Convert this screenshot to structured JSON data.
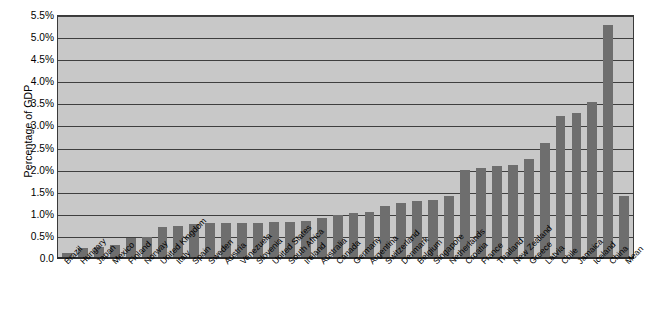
{
  "chart_data": {
    "type": "bar",
    "title": "",
    "xlabel": "",
    "ylabel": "Percentage of GDP",
    "ylim": [
      0,
      5.5
    ],
    "ytick_labels": [
      "5.5%",
      "5.0%",
      "4.5%",
      "4.0%",
      "3.5%",
      "3.0%",
      "2.5%",
      "2.0%",
      "1.5%",
      "1.0%",
      "0.5%",
      "0.0"
    ],
    "ytick_values": [
      5.5,
      5.0,
      4.5,
      4.0,
      3.5,
      3.0,
      2.5,
      2.0,
      1.5,
      1.0,
      0.5,
      0.0
    ],
    "grid": true,
    "legend": "none",
    "bar_color": "#6e6e6e",
    "plot_background": "#c8c8c8",
    "categories": [
      "Brazil",
      "Hungary",
      "Japan",
      "Mexico",
      "Finland",
      "Norway",
      "United Kingdom",
      "Italy",
      "Spain",
      "Sweden",
      "Austria",
      "Venezuela",
      "Slovenia",
      "United States",
      "South Africa",
      "Ireland",
      "Australia",
      "Canada",
      "Germany",
      "Argentina",
      "Switzerland",
      "Denmark",
      "Belgium",
      "Singapore",
      "Netherlands",
      "Croatia",
      "France",
      "Thailand",
      "New Zealand",
      "Greece",
      "Latvia",
      "Chile",
      "Jamaica",
      "Iceland",
      "China",
      "Mean"
    ],
    "values": [
      0.1,
      0.2,
      0.22,
      0.28,
      0.42,
      0.45,
      0.68,
      0.7,
      0.74,
      0.76,
      0.78,
      0.78,
      0.78,
      0.8,
      0.8,
      0.82,
      0.88,
      0.95,
      1.0,
      1.02,
      1.15,
      1.22,
      1.26,
      1.3,
      1.38,
      1.98,
      2.02,
      2.05,
      2.08,
      2.22,
      2.58,
      3.2,
      3.26,
      3.5,
      5.25,
      1.38
    ]
  }
}
